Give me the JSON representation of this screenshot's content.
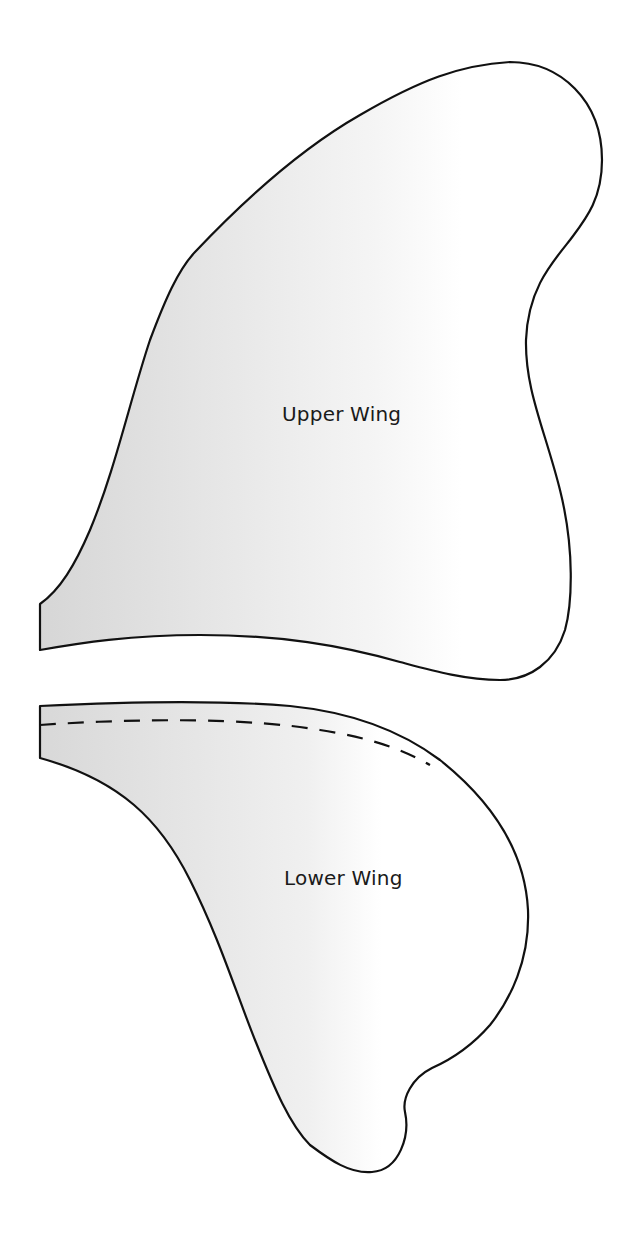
{
  "diagram": {
    "type": "sewing-pattern-template",
    "pieces": [
      {
        "id": "upper",
        "label": "Upper Wing"
      },
      {
        "id": "lower",
        "label": "Lower Wing",
        "has_fold_line": true
      }
    ],
    "colors": {
      "outline": "#111111",
      "fill_dark": "#d9d9d9",
      "fill_light": "#ffffff",
      "background": "#ffffff"
    }
  }
}
